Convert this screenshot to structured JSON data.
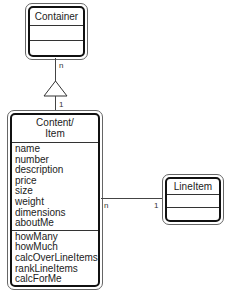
{
  "classes": {
    "container": {
      "name": "Container"
    },
    "content_item": {
      "name_line1": "Content/",
      "name_line2": "Item",
      "attributes": [
        "name",
        "number",
        "description",
        "price",
        "size",
        "weight",
        "dimensions",
        "aboutMe"
      ],
      "operations": [
        "howMany",
        "howMuch",
        "calcOverLineItems",
        "rankLineItems",
        "calcForMe",
        "rateMe"
      ]
    },
    "line_item": {
      "name": "LineItem"
    }
  },
  "relationships": {
    "container_content": {
      "container_end": "n",
      "content_end": "1",
      "type": "generalization"
    },
    "content_lineitem": {
      "content_end": "n",
      "lineitem_end": "1",
      "type": "association"
    }
  }
}
